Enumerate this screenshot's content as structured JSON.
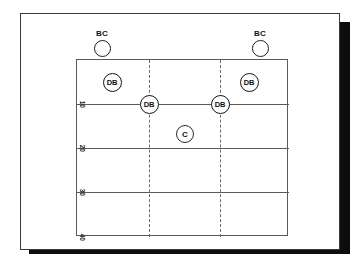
{
  "diagram": {
    "type": "football-field-diagram",
    "field": {
      "border_color": "#5a5a5a",
      "background_color": "#ffffff",
      "yard_lines": [
        {
          "id": "goal",
          "label": "",
          "y": 0
        },
        {
          "id": "y10",
          "label": "10",
          "y": 44
        },
        {
          "id": "y20",
          "label": "20",
          "y": 88
        },
        {
          "id": "y30",
          "label": "30",
          "y": 132
        },
        {
          "id": "y40",
          "label": "40",
          "y": 177
        }
      ],
      "hash_marks": [
        {
          "id": "left-hash",
          "x": 72
        },
        {
          "id": "right-hash",
          "x": 143
        }
      ]
    },
    "frame": {
      "border_color": "#3a3a3a",
      "shadow_color": "#0d0d0d"
    },
    "players": [
      {
        "id": "bc-left",
        "label": "BC",
        "role": "ball-carrier",
        "x": 25,
        "y": -12,
        "show_label": true,
        "style": "bc"
      },
      {
        "id": "bc-right",
        "label": "BC",
        "role": "ball-carrier",
        "x": 183,
        "y": -12,
        "show_label": true,
        "style": "bc"
      },
      {
        "id": "db-upper-left",
        "label": "DB",
        "role": "defensive-back",
        "x": 35,
        "y": 22,
        "show_label": false,
        "style": "db"
      },
      {
        "id": "db-upper-right",
        "label": "DB",
        "role": "defensive-back",
        "x": 172,
        "y": 22,
        "show_label": false,
        "style": "db"
      },
      {
        "id": "db-mid-left",
        "label": "DB",
        "role": "defensive-back",
        "x": 72,
        "y": 44,
        "show_label": false,
        "style": "db"
      },
      {
        "id": "db-mid-right",
        "label": "DB",
        "role": "defensive-back",
        "x": 143,
        "y": 44,
        "show_label": false,
        "style": "db"
      },
      {
        "id": "coach-center",
        "label": "C",
        "role": "coach",
        "x": 108,
        "y": 74,
        "show_label": false,
        "style": "c"
      }
    ]
  }
}
